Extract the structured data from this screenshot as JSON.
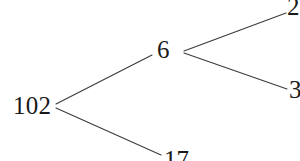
{
  "figure": {
    "kind": "factor-tree",
    "background_color": "#ffffff",
    "line_color": "#3b3b3b",
    "text_color": "#1a1a1a"
  },
  "nodes": {
    "root": "102",
    "branch": "6",
    "leaf_bottom": "17",
    "leaf_top_right": "2",
    "leaf_right": "3"
  },
  "edges": [
    {
      "name": "root-to-six",
      "from": "102",
      "to": "6",
      "x1": 56,
      "y1": 104,
      "x2": 152,
      "y2": 55
    },
    {
      "name": "root-to-seventeen",
      "from": "102",
      "to": "17",
      "x1": 56,
      "y1": 108,
      "x2": 161,
      "y2": 155
    },
    {
      "name": "six-to-two",
      "from": "6",
      "to": "2",
      "x1": 184,
      "y1": 51,
      "x2": 286,
      "y2": 13
    },
    {
      "name": "six-to-three",
      "from": "6",
      "to": "3",
      "x1": 184,
      "y1": 53,
      "x2": 287,
      "y2": 89
    }
  ]
}
